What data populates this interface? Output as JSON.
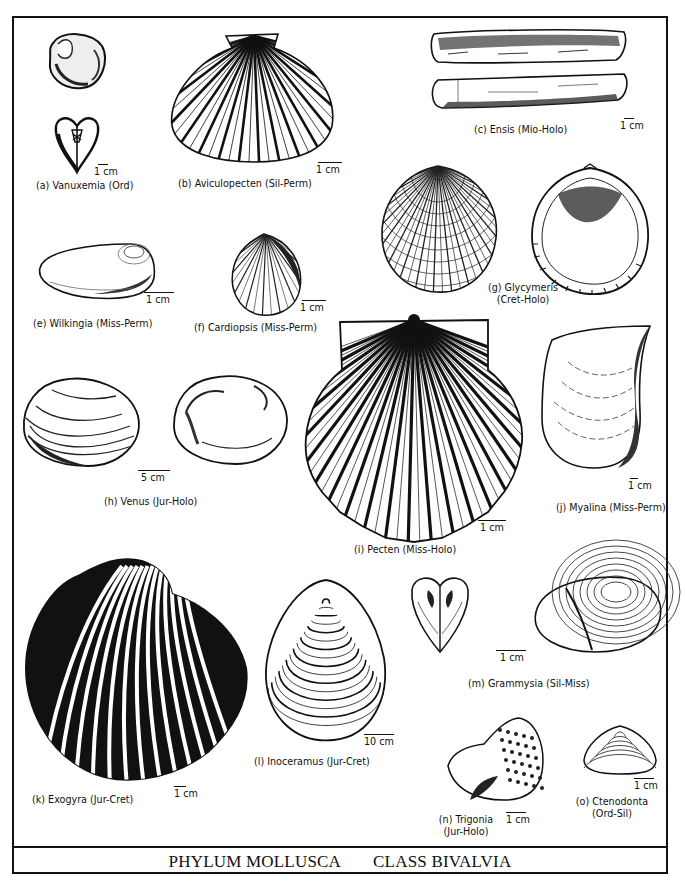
{
  "plate": {
    "title_left": "PHYLUM MOLLUSCA",
    "title_right": "CLASS BIVALVIA"
  },
  "specimens": [
    {
      "letter": "(a)",
      "genus": "Vanuxemia",
      "range": "(Ord)",
      "label": "(a)  Vanuxemia (Ord)",
      "scale": "1 cm"
    },
    {
      "letter": "(b)",
      "genus": "Aviculopecten",
      "range": "(Sil-Perm)",
      "label": "(b)  Aviculopecten (Sil-Perm)",
      "scale": "1 cm"
    },
    {
      "letter": "(c)",
      "genus": "Ensis",
      "range": "(Mio-Holo)",
      "label": "(c)  Ensis (Mio-Holo)",
      "scale": "1 cm"
    },
    {
      "letter": "(e)",
      "genus": "Wilkingia",
      "range": "(Miss-Perm)",
      "label": "(e) Wilkingia (Miss-Perm)",
      "scale": "1 cm"
    },
    {
      "letter": "(f)",
      "genus": "Cardiopsis",
      "range": "(Miss-Perm)",
      "label": "(f)  Cardiopsis (Miss-Perm)",
      "scale": "1 cm"
    },
    {
      "letter": "(g)",
      "genus": "Glycymeris",
      "range": "(Cret-Holo)",
      "label_line1": "(g) Glycymeris",
      "label_line2": "(Cret-Holo)"
    },
    {
      "letter": "(h)",
      "genus": "Venus",
      "range": "(Jur-Holo)",
      "label": "(h)  Venus (Jur-Holo)",
      "scale": "5 cm"
    },
    {
      "letter": "(i)",
      "genus": "Pecten",
      "range": "(Miss-Holo)",
      "label": "(i)  Pecten  (Miss-Holo)",
      "scale": "1 cm"
    },
    {
      "letter": "(j)",
      "genus": "Myalina",
      "range": "(Miss-Perm)",
      "label": "(j)  Myalina (Miss-Perm)",
      "scale": "1 cm"
    },
    {
      "letter": "(k)",
      "genus": "Exogyra",
      "range": "(Jur-Cret)",
      "label": "(k)  Exogyra (Jur-Cret)",
      "scale": "1 cm"
    },
    {
      "letter": "(l)",
      "genus": "Inoceramus",
      "range": "(Jur-Cret)",
      "label": "(l)  Inoceramus (Jur-Cret)",
      "scale": "10 cm"
    },
    {
      "letter": "(m)",
      "genus": "Grammysia",
      "range": "(Sil-Miss)",
      "label": "(m)  Grammysia (Sil-Miss)",
      "scale": "1 cm"
    },
    {
      "letter": "(n)",
      "genus": "Trigonia",
      "range": "(Jur-Holo)",
      "label_line1": "(n)  Trigonia",
      "label_line2": "(Jur-Holo)",
      "scale": "1 cm"
    },
    {
      "letter": "(o)",
      "genus": "Ctenodonta",
      "range": "(Ord-Sil)",
      "label_line1": "(o)  Ctenodonta",
      "label_line2": "(Ord-Sil)",
      "scale": "1 cm"
    }
  ]
}
